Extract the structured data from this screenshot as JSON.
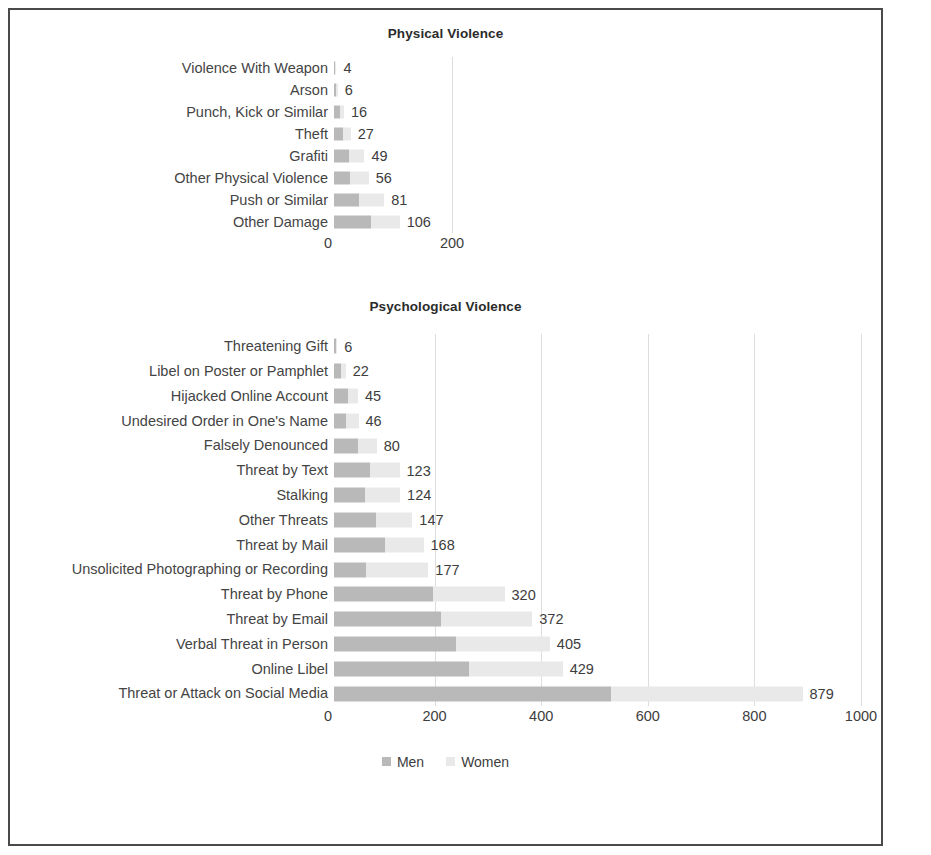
{
  "legend": {
    "items": [
      {
        "label": "Men",
        "color": "#b9b9b9"
      },
      {
        "label": "Women",
        "color": "#e9e9e9"
      }
    ]
  },
  "colors": {
    "men": "#b9b9b9",
    "women": "#e9e9e9",
    "grid": "#dddddd",
    "border": "#4a4a4a",
    "text": "#3d3d3d"
  },
  "chart_data": [
    {
      "type": "bar",
      "orientation": "horizontal",
      "stacked": true,
      "title": "Physical Violence",
      "xlabel": "",
      "ylabel": "",
      "xlim": [
        0,
        200
      ],
      "xticks": [
        0,
        200
      ],
      "grid": true,
      "legend_position": "bottom",
      "categories": [
        "Violence With Weapon",
        "Arson",
        "Punch, Kick or Similar",
        "Theft",
        "Grafiti",
        "Other Physical Violence",
        "Push or Similar",
        "Other Damage"
      ],
      "totals": [
        4,
        6,
        16,
        27,
        49,
        56,
        81,
        106
      ],
      "series": [
        {
          "name": "Men",
          "values": [
            2,
            3,
            9,
            15,
            24,
            26,
            40,
            60
          ]
        },
        {
          "name": "Women",
          "values": [
            2,
            3,
            7,
            12,
            25,
            30,
            41,
            46
          ]
        }
      ]
    },
    {
      "type": "bar",
      "orientation": "horizontal",
      "stacked": true,
      "title": "Psychological Violence",
      "xlabel": "",
      "ylabel": "",
      "xlim": [
        0,
        1000
      ],
      "xticks": [
        0,
        200,
        400,
        600,
        800,
        1000
      ],
      "grid": true,
      "legend_position": "bottom",
      "categories": [
        "Threatening Gift",
        "Libel on Poster or Pamphlet",
        "Hijacked Online Account",
        "Undesired Order in One's Name",
        "Falsely Denounced",
        "Threat by Text",
        "Stalking",
        "Other Threats",
        "Threat by Mail",
        "Unsolicited Photographing or Recording",
        "Threat by Phone",
        "Threat by Email",
        "Verbal Threat in Person",
        "Online Libel",
        "Threat or Attack on Social Media"
      ],
      "totals": [
        6,
        22,
        45,
        46,
        80,
        123,
        124,
        147,
        168,
        177,
        320,
        372,
        405,
        429,
        879
      ],
      "series": [
        {
          "name": "Men",
          "values": [
            4,
            14,
            26,
            22,
            45,
            68,
            58,
            78,
            95,
            60,
            185,
            200,
            228,
            253,
            520
          ]
        },
        {
          "name": "Women",
          "values": [
            2,
            8,
            19,
            24,
            35,
            55,
            66,
            69,
            73,
            117,
            135,
            172,
            177,
            176,
            359
          ]
        }
      ]
    }
  ]
}
